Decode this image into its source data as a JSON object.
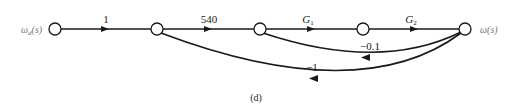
{
  "diagram": {
    "type": "signal-flow-graph",
    "caption": "(d)",
    "input": {
      "symbol": "ω",
      "subscript": "d",
      "arg": "(s)"
    },
    "output": {
      "symbol": "ω",
      "arg": "(s)"
    },
    "nodes": [
      {
        "id": "n1",
        "x": 55,
        "y": 29
      },
      {
        "id": "n2",
        "x": 157,
        "y": 29
      },
      {
        "id": "n3",
        "x": 260,
        "y": 29
      },
      {
        "id": "n4",
        "x": 363,
        "y": 29
      },
      {
        "id": "n5",
        "x": 465,
        "y": 29
      }
    ],
    "forward_branches": [
      {
        "from": "n1",
        "to": "n2",
        "gain": "1"
      },
      {
        "from": "n2",
        "to": "n3",
        "gain": "540"
      },
      {
        "from": "n3",
        "to": "n4",
        "gain": "G",
        "gain_sub": "1"
      },
      {
        "from": "n4",
        "to": "n5",
        "gain": "G",
        "gain_sub": "2"
      }
    ],
    "feedback_branches": [
      {
        "from": "n5",
        "to": "n3",
        "gain": "−0.1"
      },
      {
        "from": "n5",
        "to": "n2",
        "gain": "−1"
      }
    ],
    "colors": {
      "line": "#1a1a1a",
      "node_fill": "#ffffff",
      "io_label": "#777777"
    }
  }
}
